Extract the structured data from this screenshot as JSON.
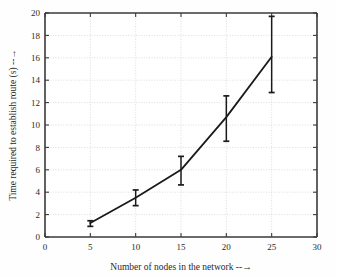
{
  "chart_data": {
    "type": "line",
    "title": "",
    "xlabel": "Number of nodes in the network --→",
    "ylabel": "Time required to establish route (s) --→",
    "x": [
      5,
      10,
      15,
      20,
      25
    ],
    "values": [
      1.25,
      3.5,
      6.0,
      10.7,
      16.1
    ],
    "error_low": [
      0.95,
      2.8,
      4.65,
      8.55,
      12.9
    ],
    "error_high": [
      1.45,
      4.2,
      7.2,
      12.6,
      19.7
    ],
    "series": [
      {
        "name": "Time required to establish route",
        "values": [
          1.25,
          3.5,
          6.0,
          10.7,
          16.1
        ]
      }
    ],
    "xlim": [
      0,
      30
    ],
    "ylim": [
      0,
      20
    ],
    "xticks": [
      0,
      5,
      10,
      15,
      20,
      25,
      30
    ],
    "yticks": [
      0,
      2,
      4,
      6,
      8,
      10,
      12,
      14,
      16,
      18,
      20
    ],
    "xtick_labels": [
      "0",
      "5",
      "10",
      "15",
      "20",
      "25",
      "30"
    ],
    "ytick_labels": [
      "0",
      "2",
      "4",
      "6",
      "8",
      "10",
      "12",
      "14",
      "16",
      "18",
      "20"
    ],
    "grid": true,
    "grid_style": "dotted",
    "legend": null,
    "legend_position": "none",
    "line_color": "#1a1a1a",
    "errorbar_color": "#1a1a1a",
    "grid_color": "#cfcfcf",
    "axis_color": "#3a3a3a",
    "background_color": "#fefefe",
    "marker": "none"
  }
}
